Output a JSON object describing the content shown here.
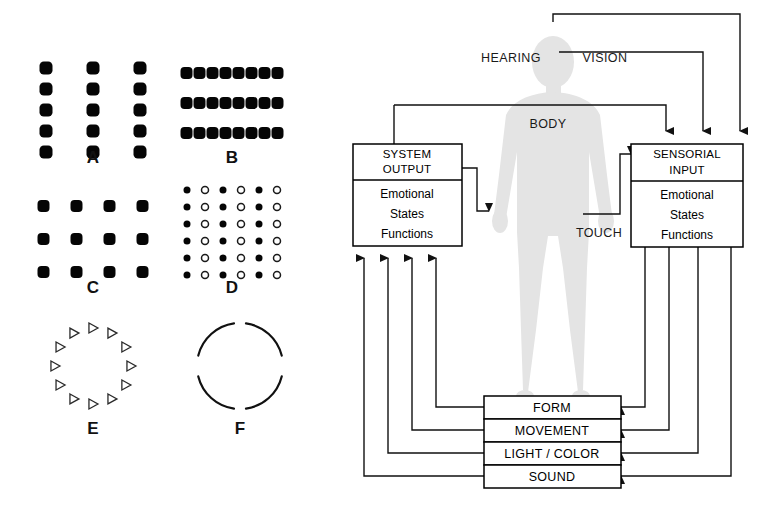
{
  "figure": {
    "title": "",
    "left_panel": {
      "name": "gestalt-pattern-panel",
      "patterns": [
        {
          "id": "A",
          "label": "A",
          "kind": "square-dot-grid",
          "description": "three vertical columns of five filled squares",
          "columns": 3,
          "rows": 5,
          "dot_shape": "rounded-square",
          "fill": "#050505",
          "spacing_x": 47,
          "spacing_y": 21,
          "dot_size": 13
        },
        {
          "id": "B",
          "label": "B",
          "kind": "square-dot-grid",
          "description": "three horizontal rows of eight filled squares",
          "columns": 8,
          "rows": 3,
          "dot_shape": "rounded-square",
          "fill": "#050505",
          "spacing_x": 13,
          "spacing_y": 30,
          "dot_size": 12
        },
        {
          "id": "C",
          "label": "C",
          "kind": "square-dot-grid",
          "description": "four columns by three rows of filled squares",
          "columns": 4,
          "rows": 3,
          "dot_shape": "rounded-square",
          "fill": "#050505",
          "spacing_x": 33,
          "spacing_y": 33,
          "dot_size": 12
        },
        {
          "id": "D",
          "label": "D",
          "kind": "alternating-circle-grid",
          "description": "six by six grid alternating filled and open circles by column",
          "columns": 6,
          "rows": 6,
          "dot_shape": "circle",
          "fill": "#050505",
          "open_stroke": "#1a1a1a",
          "spacing_x": 18,
          "spacing_y": 17,
          "dot_size": 7
        },
        {
          "id": "E",
          "label": "E",
          "kind": "triangle-ring",
          "description": "twelve open right-pointing triangles arranged on a circle",
          "count": 12,
          "radius": 38,
          "triangle_size": 9,
          "stroke": "#2a2a2a"
        },
        {
          "id": "F",
          "label": "F",
          "kind": "broken-circle",
          "description": "four arcs forming a circle with gaps at top and bottom",
          "arcs": 4,
          "radius": 43,
          "stroke": "#111111"
        }
      ]
    },
    "right_panel": {
      "name": "sensory-system-diagram",
      "figure_label": "human-body-silhouette",
      "body_color": "#e4e4e4",
      "boxes": [
        {
          "id": "system-output",
          "title_lines": [
            "SYSTEM",
            "OUTPUT"
          ],
          "body_lines": [
            "Emotional",
            "States",
            "Functions"
          ]
        },
        {
          "id": "sensorial-input",
          "title_lines": [
            "SENSORIAL",
            "INPUT"
          ],
          "body_lines": [
            "Emotional",
            "States",
            "Functions"
          ]
        }
      ],
      "channel_bars": [
        {
          "id": "form",
          "label": "FORM"
        },
        {
          "id": "movement",
          "label": "MOVEMENT"
        },
        {
          "id": "light-color",
          "label": "LIGHT / COLOR"
        },
        {
          "id": "sound",
          "label": "SOUND"
        }
      ],
      "flow_labels": [
        {
          "id": "hearing",
          "label": "HEARING"
        },
        {
          "id": "vision",
          "label": "VISION"
        },
        {
          "id": "body",
          "label": "BODY"
        },
        {
          "id": "touch",
          "label": "TOUCH"
        }
      ]
    }
  },
  "colors": {
    "ink": "#111111",
    "paper": "#ffffff",
    "body_gray": "#e4e4e4"
  }
}
